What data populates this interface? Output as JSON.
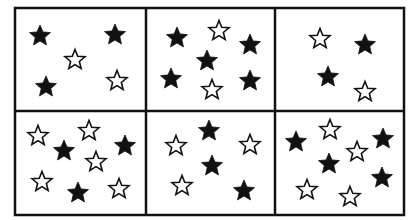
{
  "figure": {
    "colors": {
      "filled": "#111111",
      "outline": "#111111",
      "background": "#ffffff",
      "border": "#111111"
    },
    "grid": {
      "left": 15,
      "top": 8,
      "right": 404,
      "bottom": 215,
      "col_dividers": [
        146,
        275
      ],
      "row_divider": 111
    },
    "panels": [
      {
        "row": 1,
        "col": 1,
        "filled_count": 3,
        "outline_count": 2,
        "stars": [
          {
            "x": 40,
            "y": 36,
            "type": "filled"
          },
          {
            "x": 115,
            "y": 35,
            "type": "filled"
          },
          {
            "x": 75,
            "y": 60,
            "type": "outline"
          },
          {
            "x": 46,
            "y": 87,
            "type": "filled"
          },
          {
            "x": 117,
            "y": 81,
            "type": "outline"
          }
        ]
      },
      {
        "row": 1,
        "col": 2,
        "filled_count": 5,
        "outline_count": 2,
        "stars": [
          {
            "x": 177,
            "y": 38,
            "type": "filled"
          },
          {
            "x": 219,
            "y": 31,
            "type": "outline"
          },
          {
            "x": 250,
            "y": 45,
            "type": "filled"
          },
          {
            "x": 207,
            "y": 61,
            "type": "filled"
          },
          {
            "x": 171,
            "y": 79,
            "type": "filled"
          },
          {
            "x": 212,
            "y": 90,
            "type": "outline"
          },
          {
            "x": 250,
            "y": 81,
            "type": "filled"
          }
        ]
      },
      {
        "row": 1,
        "col": 3,
        "filled_count": 2,
        "outline_count": 2,
        "stars": [
          {
            "x": 320,
            "y": 39,
            "type": "outline"
          },
          {
            "x": 365,
            "y": 45,
            "type": "filled"
          },
          {
            "x": 328,
            "y": 77,
            "type": "filled"
          },
          {
            "x": 365,
            "y": 92,
            "type": "outline"
          }
        ]
      },
      {
        "row": 2,
        "col": 1,
        "filled_count": 3,
        "outline_count": 5,
        "stars": [
          {
            "x": 38,
            "y": 136,
            "type": "outline"
          },
          {
            "x": 89,
            "y": 131,
            "type": "outline"
          },
          {
            "x": 64,
            "y": 151,
            "type": "filled"
          },
          {
            "x": 125,
            "y": 146,
            "type": "filled"
          },
          {
            "x": 96,
            "y": 162,
            "type": "outline"
          },
          {
            "x": 42,
            "y": 182,
            "type": "outline"
          },
          {
            "x": 78,
            "y": 193,
            "type": "filled"
          },
          {
            "x": 119,
            "y": 189,
            "type": "outline"
          }
        ]
      },
      {
        "row": 2,
        "col": 2,
        "filled_count": 3,
        "outline_count": 3,
        "stars": [
          {
            "x": 209,
            "y": 131,
            "type": "filled"
          },
          {
            "x": 176,
            "y": 146,
            "type": "outline"
          },
          {
            "x": 250,
            "y": 145,
            "type": "outline"
          },
          {
            "x": 212,
            "y": 166,
            "type": "filled"
          },
          {
            "x": 182,
            "y": 186,
            "type": "outline"
          },
          {
            "x": 244,
            "y": 191,
            "type": "filled"
          }
        ]
      },
      {
        "row": 2,
        "col": 3,
        "filled_count": 4,
        "outline_count": 4,
        "stars": [
          {
            "x": 330,
            "y": 130,
            "type": "outline"
          },
          {
            "x": 296,
            "y": 142,
            "type": "filled"
          },
          {
            "x": 383,
            "y": 139,
            "type": "filled"
          },
          {
            "x": 357,
            "y": 152,
            "type": "outline"
          },
          {
            "x": 329,
            "y": 164,
            "type": "filled"
          },
          {
            "x": 382,
            "y": 178,
            "type": "filled"
          },
          {
            "x": 307,
            "y": 190,
            "type": "outline"
          },
          {
            "x": 350,
            "y": 197,
            "type": "outline"
          }
        ]
      }
    ]
  }
}
